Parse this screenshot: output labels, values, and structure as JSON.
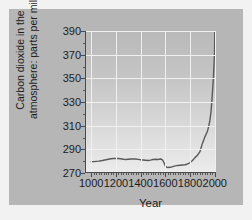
{
  "chart_data": {
    "type": "line",
    "title": "",
    "xlabel": "Year",
    "ylabel_line1": "Carbon dioxide in the",
    "ylabel_line2": "atmosphere: parts per million",
    "xlim": [
      950,
      2010
    ],
    "ylim": [
      270,
      390
    ],
    "xticks": [
      1000,
      1200,
      1400,
      1600,
      1800,
      2000
    ],
    "yticks": [
      270,
      290,
      310,
      330,
      350,
      370,
      390
    ],
    "xtick_labels": [
      "1000",
      "1200",
      "1400",
      "1600",
      "1800",
      "2000"
    ],
    "ytick_labels": [
      "270",
      "290",
      "310",
      "330",
      "350",
      "370",
      "390"
    ],
    "x_minor_step": 20,
    "y_minor_step": 10,
    "grid": true,
    "grid_color": "#f0f0f0",
    "legend": null,
    "series": [
      {
        "name": "Atmospheric CO2",
        "color": "#595959",
        "x": [
          1000,
          1020,
          1040,
          1060,
          1080,
          1100,
          1120,
          1140,
          1160,
          1180,
          1200,
          1220,
          1240,
          1260,
          1280,
          1300,
          1320,
          1340,
          1360,
          1380,
          1400,
          1420,
          1440,
          1460,
          1480,
          1500,
          1520,
          1540,
          1560,
          1570,
          1580,
          1590,
          1600,
          1610,
          1620,
          1640,
          1660,
          1680,
          1700,
          1720,
          1740,
          1760,
          1780,
          1800,
          1820,
          1840,
          1860,
          1880,
          1900,
          1920,
          1940,
          1950,
          1960,
          1970,
          1980,
          1990,
          1998,
          2000
        ],
        "y": [
          279.5,
          279.6,
          279.8,
          280.0,
          280.3,
          280.8,
          281.2,
          281.6,
          282.0,
          282.2,
          282.3,
          282.2,
          282.0,
          281.6,
          281.4,
          281.6,
          281.8,
          281.9,
          281.8,
          281.5,
          281.2,
          281.0,
          280.8,
          280.6,
          280.9,
          281.4,
          281.6,
          281.4,
          281.8,
          281.6,
          280.6,
          278.4,
          276.0,
          275.0,
          274.6,
          274.8,
          275.4,
          276.0,
          276.4,
          276.6,
          276.8,
          277.0,
          277.6,
          278.8,
          280.6,
          283.0,
          285.0,
          288.0,
          295.0,
          300.5,
          305.0,
          309.0,
          314.0,
          322.0,
          336.0,
          352.0,
          372.0,
          390.0
        ]
      }
    ]
  },
  "axis": {
    "y_label_full": "Carbon dioxide in the atmosphere: parts per million",
    "x_label": "Year"
  }
}
